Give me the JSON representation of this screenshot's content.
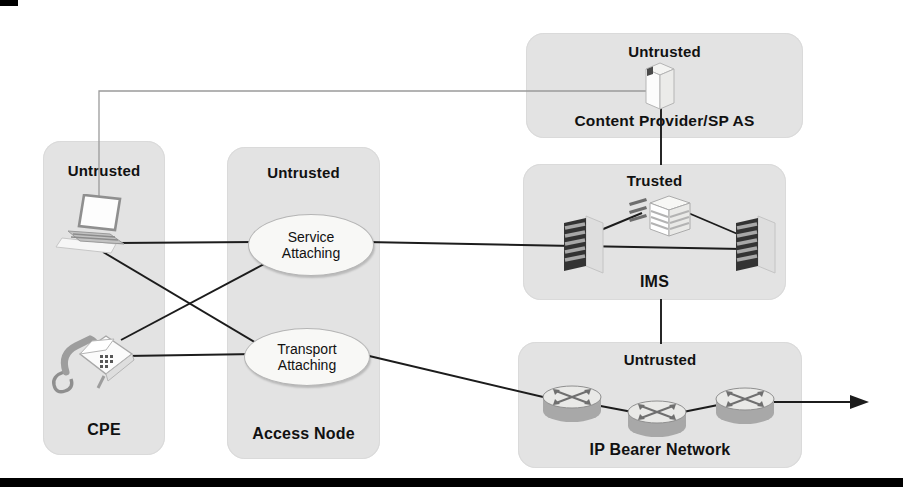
{
  "zones": {
    "cpe": {
      "trust": "Untrusted",
      "name": "CPE"
    },
    "access_node": {
      "trust": "Untrusted",
      "name": "Access Node",
      "service_attaching": "Service Attaching",
      "transport_attaching": "Transport Attaching"
    },
    "content_provider": {
      "trust": "Untrusted",
      "name": "Content Provider/SP AS"
    },
    "ims": {
      "trust": "Trusted",
      "name": "IMS"
    },
    "ip_bearer": {
      "trust": "Untrusted",
      "name": "IP Bearer Network"
    }
  },
  "icons": {
    "cpe": [
      "laptop-icon",
      "telephone-icon"
    ],
    "content_provider": [
      "application-server-icon"
    ],
    "ims": [
      "switch-tower-icon",
      "server-stack-icon",
      "switch-tower-icon"
    ],
    "ip_bearer": [
      "router-icon",
      "router-icon",
      "router-icon"
    ]
  },
  "connections": [
    {
      "from": "laptop",
      "to": "content-provider-as",
      "style": "thin-gray-elbow"
    },
    {
      "from": "laptop",
      "to": "service-attaching",
      "style": "solid"
    },
    {
      "from": "laptop",
      "to": "transport-attaching",
      "style": "solid"
    },
    {
      "from": "telephone",
      "to": "service-attaching",
      "style": "solid"
    },
    {
      "from": "telephone",
      "to": "transport-attaching",
      "style": "solid"
    },
    {
      "from": "service-attaching",
      "to": "ims-left-switch",
      "style": "solid"
    },
    {
      "from": "ims-left-switch",
      "to": "ims-right-switch",
      "style": "solid"
    },
    {
      "from": "ims-server",
      "to": "ims-left-switch",
      "style": "solid"
    },
    {
      "from": "ims-server",
      "to": "ims-right-switch",
      "style": "solid"
    },
    {
      "from": "content-provider-as",
      "to": "ims",
      "style": "solid"
    },
    {
      "from": "ims",
      "to": "ip-bearer-network",
      "style": "solid"
    },
    {
      "from": "transport-attaching",
      "to": "router-1",
      "style": "solid"
    },
    {
      "from": "router-1",
      "to": "router-2",
      "style": "solid"
    },
    {
      "from": "router-2",
      "to": "router-3",
      "style": "solid"
    },
    {
      "from": "router-3",
      "to": "east-exit",
      "style": "arrow"
    }
  ],
  "colors": {
    "zone_fill": "#e3e3e3",
    "line": "#1c1c1c",
    "thin_line": "#9b9b9b",
    "ellipse_fill": "#f8f8f6",
    "bar": "#000000"
  }
}
